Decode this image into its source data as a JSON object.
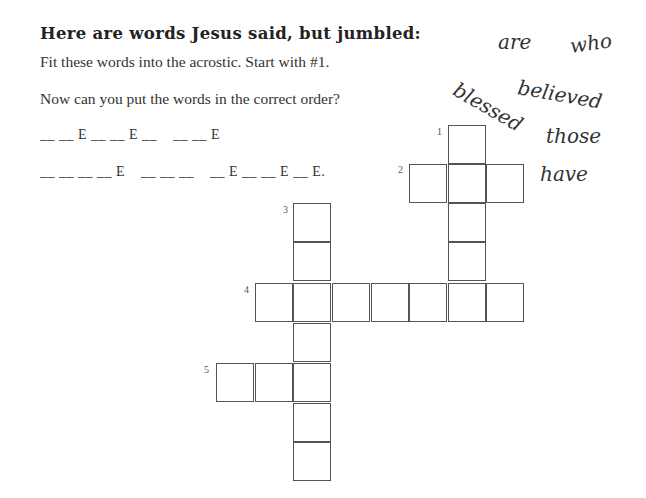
{
  "heading": "Here are words Jesus said, but jumbled:",
  "instructions": {
    "line1": "Fit these words into the acrostic. Start with #1.",
    "line2": "Now can you put the words in the correct order?"
  },
  "answer_blanks": {
    "row1": "__ __ E __ __ E __    __ __ E",
    "row2": "__ __ __ __ E    __ __ __    __ E __ __ E __ E."
  },
  "jumbled_words": [
    {
      "word": "are",
      "x": 498,
      "y": 30,
      "rotate": 0
    },
    {
      "word": "who",
      "x": 570,
      "y": 34,
      "rotate": -8
    },
    {
      "word": "blessed",
      "x": 455,
      "y": 76,
      "rotate": 30
    },
    {
      "word": "believed",
      "x": 518,
      "y": 75,
      "rotate": 10
    },
    {
      "word": "those",
      "x": 546,
      "y": 124,
      "rotate": 0
    },
    {
      "word": "have",
      "x": 540,
      "y": 162,
      "rotate": 0
    }
  ],
  "acrostic": {
    "clues": [
      {
        "number": "1",
        "direction": "down",
        "length": 5,
        "label_x": 437,
        "label_y": 126
      },
      {
        "number": "2",
        "direction": "across",
        "length": 3,
        "label_x": 398,
        "label_y": 164
      },
      {
        "number": "3",
        "direction": "down",
        "length": 7,
        "label_x": 283,
        "label_y": 204
      },
      {
        "number": "4",
        "direction": "across",
        "length": 7,
        "label_x": 244,
        "label_y": 284
      },
      {
        "number": "5",
        "direction": "across",
        "length": 3,
        "label_x": 204,
        "label_y": 364
      }
    ]
  }
}
